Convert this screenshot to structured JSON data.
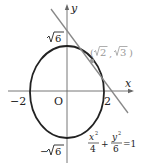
{
  "figure": {
    "axes": {
      "x_label": "x",
      "y_label": "y",
      "origin_label": "O"
    },
    "ellipse": {
      "equation": {
        "x_num": "x",
        "x_exp": "2",
        "x_den": "4",
        "plus": "+",
        "y_num": "y",
        "y_exp": "2",
        "y_den": "6",
        "rhs": "=1"
      },
      "color": "#222222"
    },
    "ticks": {
      "x_neg": "−2",
      "x_pos": "2",
      "y_pos_radical": "6",
      "y_neg_sign": "−",
      "y_neg_radical": "6"
    },
    "tangent_point": {
      "open": "(",
      "x_radical": "2",
      "sep": ",",
      "y_radical": "3",
      "close": ")",
      "color": "#999999"
    },
    "tangent_line_color": "#888888"
  }
}
